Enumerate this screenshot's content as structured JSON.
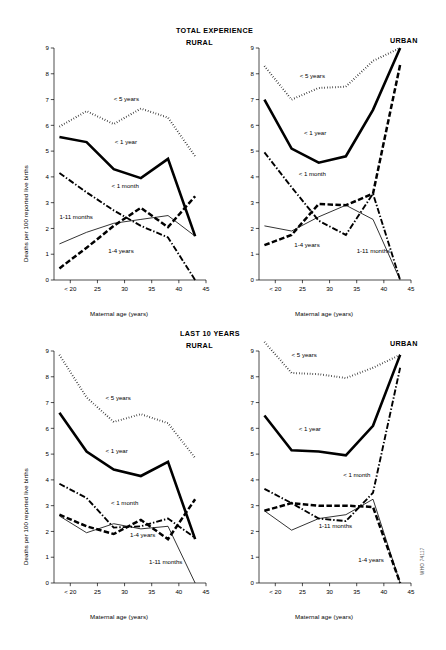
{
  "figure": {
    "code": "WHO 74117",
    "axis_x_label": "Maternal age (years)",
    "axis_y_label": "Deaths per 100 reported live births",
    "x_ticks": [
      "< 20",
      "25",
      "30",
      "35",
      "40",
      "45"
    ],
    "y_ticks": [
      "0",
      "1",
      "2",
      "3",
      "4",
      "5",
      "6",
      "7",
      "8",
      "9"
    ],
    "sections": [
      {
        "id": "total",
        "title": "TOTAL EXPERIENCE"
      },
      {
        "id": "last10",
        "title": "LAST 10 YEARS"
      }
    ],
    "panels": [
      {
        "id": "total-rural",
        "title": "RURAL"
      },
      {
        "id": "total-urban",
        "title": "URBAN"
      },
      {
        "id": "last10-rural",
        "title": "RURAL"
      },
      {
        "id": "last10-urban",
        "title": "URBAN"
      }
    ]
  },
  "chart_data": [
    {
      "id": "total-rural",
      "type": "line",
      "title": "TOTAL EXPERIENCE — RURAL",
      "xlabel": "Maternal age (years)",
      "ylabel": "Deaths per 100 reported live births",
      "xlim": [
        17,
        45
      ],
      "ylim": [
        0,
        9
      ],
      "grid": false,
      "legend": "inline-annotations",
      "x": [
        18,
        23,
        28,
        33,
        38,
        43
      ],
      "x_tick_labels": [
        "< 20",
        "25",
        "30",
        "35",
        "40",
        "45"
      ],
      "series": [
        {
          "name": "< 5 years",
          "style": "dotted",
          "values": [
            5.95,
            6.55,
            6.05,
            6.65,
            6.3,
            4.8
          ]
        },
        {
          "name": "< 1 year",
          "style": "thick-solid",
          "values": [
            5.55,
            5.35,
            4.3,
            3.95,
            4.7,
            1.7
          ]
        },
        {
          "name": "< 1 month",
          "style": "dash-dot",
          "values": [
            4.15,
            3.4,
            2.7,
            2.1,
            1.65,
            -0.1
          ]
        },
        {
          "name": "1-11 months",
          "style": "thin-solid",
          "values": [
            1.4,
            1.85,
            2.2,
            2.35,
            2.5,
            1.7
          ]
        },
        {
          "name": "1-4 years",
          "style": "thick-dash",
          "values": [
            0.45,
            1.25,
            2.1,
            2.8,
            2.05,
            3.25
          ]
        }
      ]
    },
    {
      "id": "total-urban",
      "type": "line",
      "title": "TOTAL EXPERIENCE — URBAN",
      "xlabel": "Maternal age (years)",
      "ylabel": "Deaths per 100 reported live births",
      "xlim": [
        17,
        45
      ],
      "ylim": [
        0,
        9
      ],
      "grid": false,
      "legend": "inline-annotations",
      "x": [
        18,
        23,
        28,
        33,
        38,
        43
      ],
      "x_tick_labels": [
        "< 20",
        "25",
        "30",
        "35",
        "40",
        "45"
      ],
      "series": [
        {
          "name": "< 5 years",
          "style": "dotted",
          "values": [
            8.3,
            7.0,
            7.45,
            7.5,
            8.5,
            9.0
          ]
        },
        {
          "name": "< 1 year",
          "style": "thick-solid",
          "values": [
            7.0,
            5.1,
            4.55,
            4.8,
            6.6,
            9.0
          ]
        },
        {
          "name": "< 1 month",
          "style": "dash-dot",
          "values": [
            4.95,
            3.6,
            2.3,
            1.75,
            3.35,
            0.0
          ]
        },
        {
          "name": "1-11 months",
          "style": "thin-solid",
          "values": [
            2.1,
            1.9,
            2.45,
            2.9,
            2.35,
            0.0
          ]
        },
        {
          "name": "1-4 years",
          "style": "thick-dash",
          "values": [
            1.35,
            1.75,
            2.95,
            2.9,
            3.35,
            8.35
          ]
        }
      ]
    },
    {
      "id": "last10-rural",
      "type": "line",
      "title": "LAST 10 YEARS — RURAL",
      "xlabel": "Maternal age (years)",
      "ylabel": "Deaths per 100 reported live births",
      "xlim": [
        17,
        45
      ],
      "ylim": [
        0,
        9
      ],
      "grid": false,
      "legend": "inline-annotations",
      "x": [
        18,
        23,
        28,
        33,
        38,
        43
      ],
      "x_tick_labels": [
        "< 20",
        "25",
        "30",
        "35",
        "40",
        "45"
      ],
      "series": [
        {
          "name": "< 5 years",
          "style": "dotted",
          "values": [
            8.85,
            7.2,
            6.25,
            6.55,
            6.2,
            4.85
          ]
        },
        {
          "name": "< 1 year",
          "style": "thick-solid",
          "values": [
            6.6,
            5.1,
            4.4,
            4.15,
            4.7,
            1.7
          ]
        },
        {
          "name": "< 1 month",
          "style": "dash-dot",
          "values": [
            3.85,
            3.3,
            2.15,
            2.2,
            2.5,
            1.75
          ]
        },
        {
          "name": "1-11 months",
          "style": "thin-solid",
          "values": [
            2.6,
            1.95,
            2.3,
            2.1,
            2.2,
            -0.1
          ]
        },
        {
          "name": "1-4 years",
          "style": "thick-dash",
          "values": [
            2.65,
            2.2,
            1.9,
            2.45,
            1.7,
            3.25
          ]
        }
      ]
    },
    {
      "id": "last10-urban",
      "type": "line",
      "title": "LAST 10 YEARS — URBAN",
      "xlabel": "Maternal age (years)",
      "ylabel": "Deaths per 100 reported live births",
      "xlim": [
        17,
        45
      ],
      "ylim": [
        0,
        9
      ],
      "grid": false,
      "legend": "inline-annotations",
      "x": [
        18,
        23,
        28,
        33,
        38,
        43
      ],
      "x_tick_labels": [
        "< 20",
        "25",
        "30",
        "35",
        "40",
        "45"
      ],
      "series": [
        {
          "name": "< 5 years",
          "style": "dotted",
          "values": [
            9.35,
            8.15,
            8.1,
            7.95,
            8.35,
            8.85
          ]
        },
        {
          "name": "< 1 year",
          "style": "thick-solid",
          "values": [
            6.5,
            5.15,
            5.1,
            4.95,
            6.1,
            8.85
          ]
        },
        {
          "name": "< 1 month",
          "style": "dash-dot",
          "values": [
            3.65,
            3.1,
            2.5,
            2.4,
            3.5,
            8.35
          ]
        },
        {
          "name": "1-11 months",
          "style": "thin-solid",
          "values": [
            2.8,
            2.05,
            2.5,
            2.65,
            3.25,
            0.0
          ]
        },
        {
          "name": "1-4 years",
          "style": "thick-dash",
          "values": [
            2.8,
            3.1,
            3.0,
            3.0,
            2.95,
            0.0
          ]
        }
      ]
    }
  ],
  "annotations": {
    "total-rural": [
      {
        "text": "< 5 years",
        "x": 28.0,
        "y": 6.95
      },
      {
        "text": "< 1 year",
        "x": 28.2,
        "y": 5.28
      },
      {
        "text": "< 1 month",
        "x": 27.6,
        "y": 3.55
      },
      {
        "text": "1-11 months",
        "x": 18.0,
        "y": 2.35
      },
      {
        "text": "1-4 years",
        "x": 27.0,
        "y": 1.05
      }
    ],
    "total-urban": [
      {
        "text": "< 5 years",
        "x": 24.5,
        "y": 7.82
      },
      {
        "text": "< 1 year",
        "x": 25.3,
        "y": 5.62
      },
      {
        "text": "< 1 month",
        "x": 24.3,
        "y": 4.02
      },
      {
        "text": "1-4 years",
        "x": 23.5,
        "y": 1.28
      },
      {
        "text": "1-11 months",
        "x": 35.0,
        "y": 1.05
      }
    ],
    "last10-rural": [
      {
        "text": "< 5 years",
        "x": 26.5,
        "y": 7.08
      },
      {
        "text": "< 1 year",
        "x": 26.5,
        "y": 5.05
      },
      {
        "text": "< 1 month",
        "x": 27.5,
        "y": 3.02
      },
      {
        "text": "1-4 years",
        "x": 31.0,
        "y": 1.78
      },
      {
        "text": "1-11 months",
        "x": 34.5,
        "y": 0.72
      }
    ],
    "last10-urban": [
      {
        "text": "< 5 years",
        "x": 23.0,
        "y": 8.78
      },
      {
        "text": "< 1 year",
        "x": 24.3,
        "y": 5.88
      },
      {
        "text": "< 1 month",
        "x": 32.5,
        "y": 4.12
      },
      {
        "text": "1-11 months",
        "x": 28.0,
        "y": 2.12
      },
      {
        "text": "1-4 years",
        "x": 35.3,
        "y": 0.82
      }
    ]
  }
}
